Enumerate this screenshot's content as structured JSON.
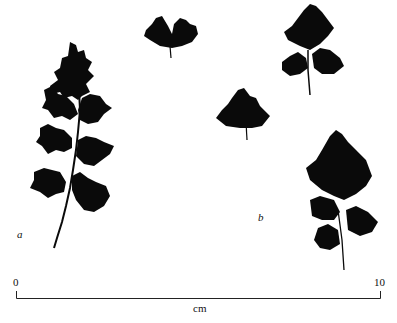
{
  "labels": {
    "a": "a",
    "b": "b"
  },
  "scale_bar": {
    "start": "0",
    "end": "10",
    "unit": "cm"
  },
  "colors": {
    "leaf": "#0a0a0a",
    "ink": "#222222",
    "background": "#ffffff"
  }
}
